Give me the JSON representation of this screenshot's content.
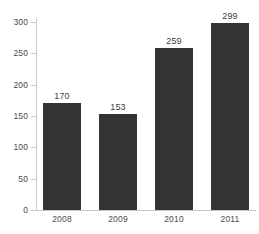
{
  "chart_data": {
    "type": "bar",
    "title": "",
    "subtitle": "",
    "xlabel": "",
    "ylabel": "",
    "categories": [
      "2008",
      "2009",
      "2010",
      "2011"
    ],
    "values": [
      170,
      153,
      259,
      299
    ],
    "data_labels": [
      "170",
      "153",
      "259",
      "299"
    ],
    "ylim": [
      0,
      300
    ],
    "y_ticks": [
      0,
      50,
      100,
      150,
      200,
      250,
      300
    ],
    "y_tick_labels": [
      "0",
      "50",
      "100",
      "150",
      "200",
      "250",
      "300"
    ],
    "grid": false,
    "legend": null,
    "series": [
      {
        "name": "",
        "values": [
          170,
          153,
          259,
          299
        ],
        "color": "#333333"
      }
    ],
    "colors": {
      "bar": "#333333",
      "axis": "#c9c9c9",
      "text": "#4a4a4a",
      "data_label": "#3d3d3d",
      "background": "#ffffff"
    }
  }
}
